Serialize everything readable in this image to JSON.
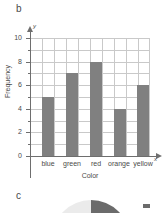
{
  "panels": {
    "b": {
      "letter": "b"
    },
    "c": {
      "letter": "c"
    }
  },
  "chart_data": [
    {
      "type": "bar",
      "panel": "b",
      "title": "",
      "categories": [
        "blue",
        "green",
        "red",
        "orange",
        "yellow"
      ],
      "values": [
        5,
        7,
        8,
        4,
        6
      ],
      "xlabel": "Color",
      "ylabel": "Frequency",
      "ylim": [
        0,
        10
      ],
      "ytick_labels": [
        "0",
        "2",
        "4",
        "6",
        "8",
        "10"
      ],
      "ytick_values": [
        0,
        2,
        4,
        6,
        8,
        10
      ],
      "minor_tick_values": [
        1,
        3,
        5,
        7,
        9
      ],
      "grid": true,
      "legend": "none",
      "axis_var_y": "y",
      "axis_var_x": "x",
      "bar_color": "#808080",
      "grid_color": "#c9c9c9",
      "axis_color": "#6e6e6e"
    },
    {
      "type": "pie",
      "panel": "c",
      "title": "",
      "note": "partially cropped at bottom edge",
      "slices": [
        {
          "label": "",
          "color": "#6b6b6b",
          "fraction": 0.33
        },
        {
          "label": "",
          "color": "#ebebeb",
          "fraction": 0.67
        }
      ],
      "legend": "right"
    }
  ],
  "pie_legend": {
    "rows": [
      {
        "label": "",
        "color": "#6b6b6b"
      }
    ]
  }
}
